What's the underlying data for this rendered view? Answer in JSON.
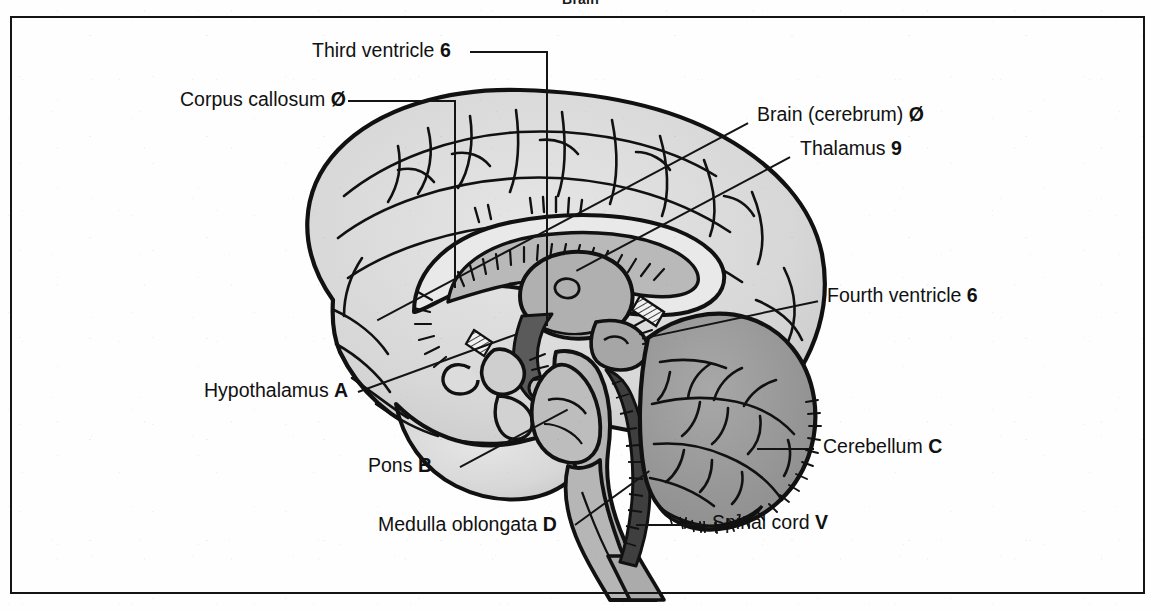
{
  "figure": {
    "title": "Brain",
    "type": "mid-sagittal-section-diagram",
    "frame_color": "#141414",
    "ink_color": "#111111",
    "cerebrum_fill": "#d9d9d9",
    "cerebellum_fill": "#9a9a9a",
    "brainstem_fill": "#b3b3b3",
    "background": "#ffffff"
  },
  "labels": [
    {
      "id": "third-ventricle",
      "text": "Third ventricle",
      "key": "6",
      "side": "left"
    },
    {
      "id": "corpus-callosum",
      "text": "Corpus callosum",
      "key": "Ø",
      "side": "left"
    },
    {
      "id": "hypothalamus",
      "text": "Hypothalamus",
      "key": "A",
      "side": "left"
    },
    {
      "id": "pons",
      "text": "Pons",
      "key": "B",
      "side": "left"
    },
    {
      "id": "medulla-oblongata",
      "text": "Medulla oblongata",
      "key": "D",
      "side": "left"
    },
    {
      "id": "brain-cerebrum",
      "text": "Brain (cerebrum)",
      "key": "Ø",
      "side": "right"
    },
    {
      "id": "thalamus",
      "text": "Thalamus",
      "key": "9",
      "side": "right"
    },
    {
      "id": "fourth-ventricle",
      "text": "Fourth ventricle",
      "key": "6",
      "side": "right"
    },
    {
      "id": "cerebellum",
      "text": "Cerebellum",
      "key": "C",
      "side": "right"
    },
    {
      "id": "spinal-cord",
      "text": "Spinal cord",
      "key": "V",
      "side": "right"
    }
  ]
}
